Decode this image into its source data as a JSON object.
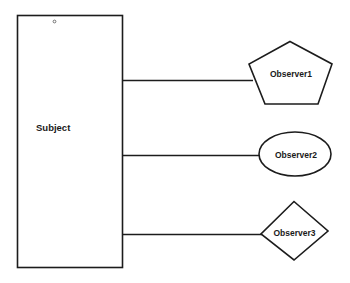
{
  "diagram": {
    "colors": {
      "stroke": "#1c1c1c",
      "fill": "#ffffff",
      "text": "#1a1a1a",
      "background": "#ffffff"
    },
    "subject": {
      "label": "Subject",
      "shape": "rectangle"
    },
    "observers": [
      {
        "label": "Observer1",
        "shape": "pentagon"
      },
      {
        "label": "Observer2",
        "shape": "ellipse"
      },
      {
        "label": "Observer3",
        "shape": "diamond"
      }
    ],
    "connections": [
      {
        "from": "Subject",
        "to": "Observer1"
      },
      {
        "from": "Subject",
        "to": "Observer2"
      },
      {
        "from": "Subject",
        "to": "Observer3"
      }
    ]
  }
}
